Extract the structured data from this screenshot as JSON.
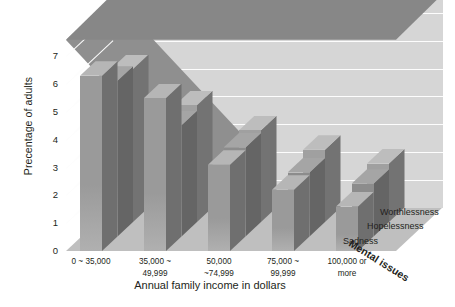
{
  "chart_data": {
    "type": "bar",
    "title": "",
    "subtitle": "",
    "xlabel": "Annual family income in dollars",
    "ylabel": "Precentage of adults",
    "zlabel": "Mental issues",
    "categories": [
      "0 ~ 35,000",
      "35,000 ~ 49,999",
      "50,000 ~74,999",
      "75,000 ~ 99,999",
      "100,000 or more"
    ],
    "category_lines": [
      [
        "0 ~ 35,000",
        ""
      ],
      [
        "35,000 ~",
        "49,999"
      ],
      [
        "50,000",
        "~74,999"
      ],
      [
        "75,000 ~",
        "99,999"
      ],
      [
        "100,000 or",
        "more"
      ]
    ],
    "series": [
      {
        "name": "Worthlessness",
        "values": [
          5.5,
          4.2,
          3.3,
          2.6,
          2.1
        ],
        "color": "#a0a0a0"
      },
      {
        "name": "Hopelessness",
        "values": [
          5.6,
          4.0,
          3.2,
          2.3,
          1.9
        ],
        "color": "#8c8c8c"
      },
      {
        "name": "Sadness",
        "values": [
          6.3,
          5.5,
          3.1,
          2.2,
          1.6
        ],
        "color": "#9a9a9a"
      }
    ],
    "yticks": [
      0,
      1,
      2,
      3,
      4,
      5,
      6,
      7
    ],
    "ylim": [
      0,
      7.6
    ],
    "grid": true,
    "legend_position": "right-inline-3d",
    "background": "#ffffff",
    "plot_background": "#d6d6d6",
    "gridline_color": "#fdfdfd"
  }
}
